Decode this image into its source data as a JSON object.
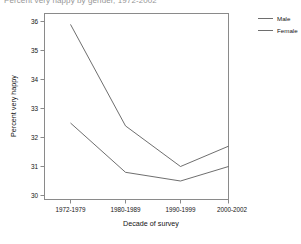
{
  "chart_data": {
    "type": "line",
    "title": "Percent very happy by gender, 1972-2002",
    "xlabel": "Decade of survey",
    "ylabel": "Percent very happy",
    "categories": [
      "1972-1979",
      "1980-1989",
      "1990-1999",
      "2000-2002"
    ],
    "series": [
      {
        "name": "Male",
        "values": [
          35.9,
          32.4,
          31.0,
          31.7
        ]
      },
      {
        "name": "Female",
        "values": [
          32.5,
          30.8,
          30.5,
          31.0
        ]
      }
    ],
    "ylim": [
      29.7,
      36.2
    ],
    "yticks": [
      30,
      31,
      32,
      33,
      34,
      35,
      36
    ],
    "ytick_labels": [
      "30",
      "31",
      "32",
      "33",
      "34",
      "35",
      "36"
    ],
    "grid": false,
    "legend_position": "right",
    "line_color": "#5e5e5e",
    "axis_color": "#8a8a8a"
  },
  "legend": {
    "items": [
      {
        "label": "Male"
      },
      {
        "label": "Female"
      }
    ]
  }
}
